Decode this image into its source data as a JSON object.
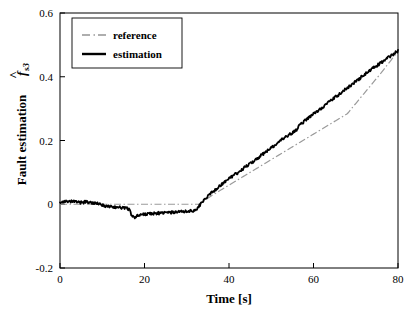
{
  "chart_data": {
    "type": "line",
    "title": "",
    "xlabel": "Time [s]",
    "ylabel_text": "Fault estimation",
    "ylabel_symbol": "f",
    "ylabel_symbol_sub": "s3",
    "ylabel_symbol_accent": "hat",
    "xlim": [
      0,
      80
    ],
    "ylim": [
      -0.2,
      0.6
    ],
    "xticks": [
      0,
      20,
      40,
      60,
      80
    ],
    "xtick_labels": [
      "0",
      "20",
      "40",
      "60",
      "80"
    ],
    "yticks": [
      -0.2,
      0,
      0.2,
      0.4,
      0.6
    ],
    "ytick_labels": [
      "-0.2",
      "0",
      "0.2",
      "0.4",
      "0.6"
    ],
    "grid": false,
    "legend_position": "upper left",
    "tick_direction": "in",
    "series": [
      {
        "name": "reference",
        "style": "dashdot",
        "color": "#9a9a9a",
        "width": 1.2,
        "x": [
          0,
          4,
          8,
          12,
          16,
          20,
          24,
          28,
          32,
          33,
          36,
          40,
          44,
          48,
          52,
          56,
          60,
          64,
          68,
          72,
          76,
          80
        ],
        "y": [
          0,
          0,
          0,
          0,
          0,
          0,
          0,
          0,
          0,
          0.0,
          0.028,
          0.06,
          0.092,
          0.124,
          0.156,
          0.188,
          0.22,
          0.252,
          0.284,
          0.348,
          0.412,
          0.48
        ]
      },
      {
        "name": "estimation",
        "style": "solid",
        "color": "#000000",
        "width": 1.8,
        "x": [
          0,
          1,
          2,
          3,
          4,
          5,
          6,
          7,
          8,
          9,
          10,
          11,
          12,
          13,
          14,
          15,
          16,
          16.5,
          17,
          17.5,
          18,
          19,
          20,
          21,
          22,
          23,
          24,
          25,
          26,
          27,
          28,
          29,
          30,
          31,
          32,
          32.5,
          33,
          34,
          35,
          36,
          37,
          38,
          39,
          40,
          42,
          44,
          46,
          48,
          50,
          52,
          54,
          55,
          56,
          56.5,
          57,
          58,
          60,
          62,
          64,
          66,
          68,
          70,
          72,
          74,
          76,
          78,
          80
        ],
        "y": [
          0.008,
          0.009,
          0.006,
          0.009,
          0.007,
          0.005,
          0.008,
          0.006,
          0.004,
          0.001,
          -0.003,
          -0.006,
          -0.008,
          -0.009,
          -0.01,
          -0.011,
          -0.012,
          -0.02,
          -0.038,
          -0.041,
          -0.038,
          -0.034,
          -0.031,
          -0.03,
          -0.029,
          -0.028,
          -0.028,
          -0.027,
          -0.026,
          -0.025,
          -0.024,
          -0.023,
          -0.022,
          -0.021,
          -0.019,
          -0.014,
          -0.004,
          0.012,
          0.026,
          0.038,
          0.048,
          0.06,
          0.07,
          0.081,
          0.098,
          0.118,
          0.137,
          0.157,
          0.177,
          0.197,
          0.216,
          0.224,
          0.232,
          0.246,
          0.252,
          0.262,
          0.283,
          0.303,
          0.324,
          0.344,
          0.365,
          0.385,
          0.406,
          0.426,
          0.444,
          0.463,
          0.481
        ]
      }
    ],
    "noise_amplitude": 0.0045,
    "legend_entries": [
      {
        "label": "reference",
        "style": "dashdot",
        "color": "#9a9a9a"
      },
      {
        "label": "estimation",
        "style": "solid",
        "color": "#000000"
      }
    ]
  },
  "figure": {
    "background": "#ffffff",
    "axis_color": "#000000",
    "plot_left": 60,
    "plot_right": 398,
    "plot_top": 13,
    "plot_bottom": 268
  }
}
